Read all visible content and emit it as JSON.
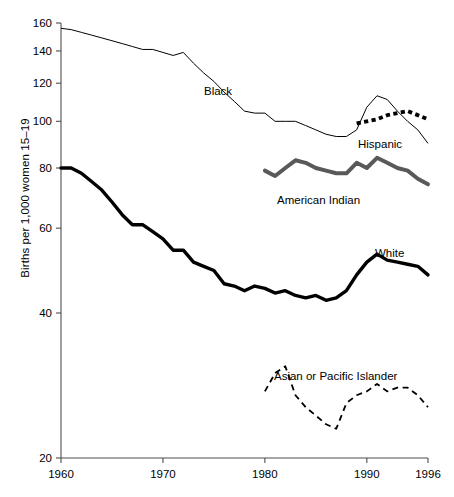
{
  "chart_data": {
    "type": "line",
    "title": "",
    "xlabel": "",
    "ylabel": "Births per 1,000 women 15–19",
    "yscale": "log",
    "ylim": [
      20,
      160
    ],
    "xlim": [
      1960,
      1996
    ],
    "grid": false,
    "legend": "inline-labels",
    "yticks": [
      20,
      40,
      60,
      80,
      100,
      120,
      140,
      160
    ],
    "ytick_labels": [
      "20",
      "40",
      "60",
      "80",
      "100",
      "120",
      "140",
      "160"
    ],
    "xticks": [
      1960,
      1970,
      1980,
      1990,
      1996
    ],
    "xtick_labels": [
      "1960",
      "1970",
      "1980",
      "1990",
      "1996"
    ],
    "series": [
      {
        "name": "Black",
        "label": "Black",
        "style": "thin-solid",
        "color": "#000000",
        "x": [
          1960,
          1961,
          1962,
          1963,
          1964,
          1965,
          1966,
          1967,
          1968,
          1969,
          1970,
          1971,
          1972,
          1973,
          1974,
          1975,
          1976,
          1977,
          1978,
          1979,
          1980,
          1981,
          1982,
          1983,
          1984,
          1985,
          1986,
          1987,
          1988,
          1989,
          1990,
          1991,
          1992,
          1993,
          1994,
          1995,
          1996
        ],
        "values": [
          156,
          155,
          153,
          151,
          149,
          147,
          145,
          143,
          141,
          141,
          139,
          137,
          139,
          132,
          126,
          121,
          115,
          110,
          105,
          104,
          104,
          100,
          100,
          100,
          98,
          96,
          94,
          93,
          93,
          96,
          107,
          113,
          111,
          105,
          100,
          96,
          90
        ]
      },
      {
        "name": "White",
        "label": "White",
        "style": "thick-solid",
        "color": "#000000",
        "x": [
          1960,
          1961,
          1962,
          1963,
          1964,
          1965,
          1966,
          1967,
          1968,
          1969,
          1970,
          1971,
          1972,
          1973,
          1974,
          1975,
          1976,
          1977,
          1978,
          1979,
          1980,
          1981,
          1982,
          1983,
          1984,
          1985,
          1986,
          1987,
          1988,
          1989,
          1990,
          1991,
          1992,
          1993,
          1994,
          1995,
          1996
        ],
        "values": [
          80,
          80,
          78,
          75,
          72,
          68,
          64,
          61,
          61,
          59,
          57,
          54,
          54,
          51,
          50,
          49,
          46,
          45.5,
          44.5,
          45.5,
          45,
          44,
          44.5,
          43.5,
          43,
          43.5,
          42.5,
          43,
          44.5,
          48,
          51,
          53,
          51.5,
          51,
          50.5,
          50,
          48
        ]
      },
      {
        "name": "American Indian",
        "label": "American Indian",
        "style": "thick-gray",
        "color": "#595959",
        "x": [
          1980,
          1981,
          1982,
          1983,
          1984,
          1985,
          1986,
          1987,
          1988,
          1989,
          1990,
          1991,
          1992,
          1993,
          1994,
          1995,
          1996
        ],
        "values": [
          79,
          77,
          80,
          83,
          82,
          80,
          79,
          78,
          78,
          82,
          80,
          84,
          82,
          80,
          79,
          76,
          74
        ]
      },
      {
        "name": "Hispanic",
        "label": "Hispanic",
        "style": "thick-dotted",
        "color": "#000000",
        "x": [
          1989,
          1990,
          1991,
          1992,
          1993,
          1994,
          1995,
          1996
        ],
        "values": [
          99,
          100,
          101,
          103,
          104,
          105,
          103,
          101
        ]
      },
      {
        "name": "Asian or Pacific Islander",
        "label": "Asian or Pacific Islander",
        "style": "dashed",
        "color": "#000000",
        "x": [
          1980,
          1981,
          1982,
          1983,
          1984,
          1985,
          1986,
          1987,
          1988,
          1989,
          1990,
          1991,
          1992,
          1993,
          1994,
          1995,
          1996
        ],
        "values": [
          27.5,
          30,
          31,
          27,
          25.5,
          24.5,
          23.5,
          23,
          26,
          27,
          27.5,
          28.5,
          27.5,
          28,
          28,
          27,
          25.5
        ]
      }
    ]
  },
  "axis": {
    "y_title": "Births per 1,000 women 15–19"
  },
  "labels": {
    "black": "Black",
    "white": "White",
    "american_indian": "American Indian",
    "hispanic": "Hispanic",
    "asian": "Asian or Pacific Islander"
  }
}
